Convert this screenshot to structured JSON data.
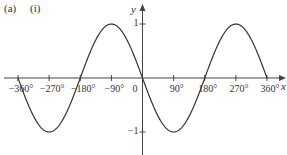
{
  "header": {
    "part_label": "(a)",
    "subpart_label": "(i)"
  },
  "chart_data": {
    "type": "line",
    "title": "",
    "function": "y = -sin(x)",
    "xlabel": "x",
    "ylabel": "y",
    "xlim": [
      -360,
      360
    ],
    "ylim": [
      -1,
      1
    ],
    "grid": false,
    "legend": null,
    "x_ticks": [
      -360,
      -270,
      -180,
      -90,
      0,
      90,
      180,
      270,
      360
    ],
    "x_tick_labels": [
      "−360°",
      "−270°",
      "−180°",
      "−90°",
      "0",
      "90°",
      "180°",
      "270°",
      "360°"
    ],
    "y_ticks": [
      1,
      -1
    ],
    "y_tick_labels": [
      "1",
      "−1"
    ],
    "series": [
      {
        "name": "curve",
        "x": [
          -360,
          -315,
          -270,
          -225,
          -180,
          -135,
          -90,
          -45,
          0,
          45,
          90,
          135,
          180,
          225,
          270,
          315,
          360
        ],
        "values": [
          0,
          -0.707,
          -1,
          -0.707,
          0,
          0.707,
          1,
          0.707,
          0,
          -0.707,
          -1,
          -0.707,
          0,
          0.707,
          1,
          0.707,
          0
        ]
      }
    ],
    "color": "#333333"
  }
}
